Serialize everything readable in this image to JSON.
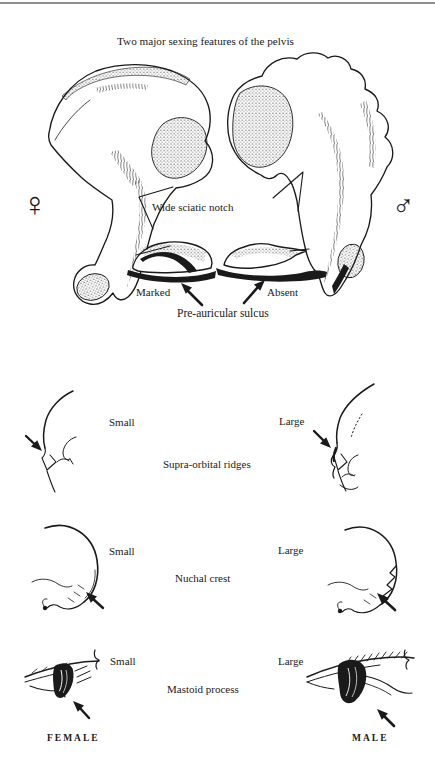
{
  "figure": {
    "title": "Two major sexing features of the pelvis"
  },
  "pelvis": {
    "female_symbol": "♀",
    "male_symbol": "♂",
    "notch_label": "Wide sciatic notch",
    "sulcus_left": "Marked",
    "sulcus_right": "Absent",
    "sulcus_caption": "Pre-auricular sulcus"
  },
  "skull_features": [
    {
      "name": "Supra-orbital ridges",
      "left": "Small",
      "right": "Large"
    },
    {
      "name": "Nuchal crest",
      "left": "Small",
      "right": "Large"
    },
    {
      "name": "Mastoid process",
      "left": "Small",
      "right": "Large"
    }
  ],
  "footer": {
    "female": "FEMALE",
    "male": "MALE"
  },
  "colors": {
    "ink": "#1a1a1a",
    "paper": "#ffffff",
    "top_rule": "#8f8f8f"
  }
}
